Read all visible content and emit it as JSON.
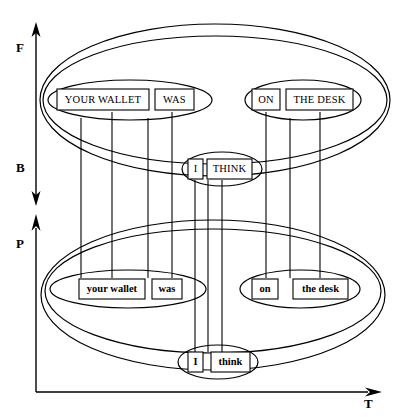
{
  "figure": {
    "type": "diagram",
    "background": "#ffffff",
    "stroke_color": "#000000"
  },
  "axes": {
    "vertical_upper": {
      "name": "F-B axis",
      "top_label": "F",
      "bottom_label": "B",
      "style": "double-headed arrow"
    },
    "vertical_lower": {
      "name": "P axis",
      "label": "P",
      "style": "single-headed arrow pointing up"
    },
    "horizontal": {
      "name": "T axis",
      "label": "T",
      "style": "single-headed arrow pointing right"
    }
  },
  "upper_level": {
    "name": "upper-ellipse-cluster",
    "groups": [
      {
        "name": "upper-left-group",
        "boxes": [
          {
            "label": "YOUR WALLET"
          },
          {
            "label": "WAS"
          }
        ]
      },
      {
        "name": "upper-right-group",
        "boxes": [
          {
            "label": "ON"
          },
          {
            "label": "THE DESK"
          }
        ]
      },
      {
        "name": "upper-middle-group",
        "boxes": [
          {
            "label": "I"
          },
          {
            "label": "THINK"
          }
        ]
      }
    ]
  },
  "lower_level": {
    "name": "lower-ellipse-cluster",
    "groups": [
      {
        "name": "lower-left-group",
        "boxes": [
          {
            "label": "your wallet"
          },
          {
            "label": "was"
          }
        ]
      },
      {
        "name": "lower-right-group",
        "boxes": [
          {
            "label": "on"
          },
          {
            "label": "the desk"
          }
        ]
      },
      {
        "name": "lower-middle-group",
        "boxes": [
          {
            "label": "I"
          },
          {
            "label": "think"
          }
        ]
      }
    ]
  },
  "connections": {
    "count": 10,
    "note": "Vertical lines linking upper-level boxes and ellipse boundaries to the corresponding lower-level boxes."
  }
}
